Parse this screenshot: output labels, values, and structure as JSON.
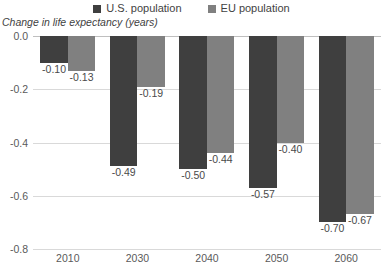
{
  "chart_data": {
    "type": "bar",
    "title": "",
    "subtitle": "",
    "xlabel": "",
    "ylabel": "Change in life expectancy (years)",
    "categories": [
      "2010",
      "2030",
      "2040",
      "2050",
      "2060"
    ],
    "series": [
      {
        "name": "U.S. population",
        "color": "#3f3f3f",
        "values": [
          -0.1,
          -0.49,
          -0.5,
          -0.57,
          -0.7
        ],
        "labels": [
          "-0.10",
          "-0.49",
          "-0.50",
          "-0.57",
          "-0.70"
        ]
      },
      {
        "name": "EU population",
        "color": "#808080",
        "values": [
          -0.13,
          -0.19,
          -0.44,
          -0.4,
          -0.67
        ],
        "labels": [
          "-0.13",
          "-0.19",
          "-0.44",
          "-0.40",
          "-0.67"
        ]
      }
    ],
    "ylim": [
      -0.8,
      0.0
    ],
    "yticks": [
      0.0,
      -0.2,
      -0.4,
      -0.6,
      -0.8
    ],
    "ytick_labels": [
      "0.0",
      "-0.2",
      "-0.4",
      "-0.6",
      "-0.8"
    ],
    "grid": true,
    "legend_position": "top",
    "orientation": "vertical",
    "bar_direction": "downward"
  },
  "legend": {
    "items": [
      {
        "label": "U.S. population",
        "color": "#3f3f3f"
      },
      {
        "label": "EU population",
        "color": "#808080"
      }
    ]
  },
  "axis": {
    "y_title": "Change in life expectancy (years)"
  }
}
